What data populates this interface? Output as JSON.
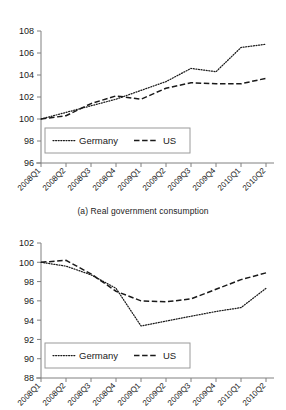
{
  "figure": {
    "panels": [
      {
        "id": "a",
        "caption": "(a)  Real government consumption",
        "caption_label": "(a)",
        "caption_title": "Real government consumption"
      },
      {
        "id": "b",
        "caption": "",
        "caption_label": "",
        "caption_title": ""
      }
    ]
  },
  "legend": {
    "germany": "Germany",
    "us": "US"
  },
  "chart_data": [
    {
      "type": "line",
      "title": "(a)  Real government consumption",
      "xlabel": "",
      "ylabel": "",
      "ylim": [
        96,
        108
      ],
      "yticks": [
        96,
        98,
        100,
        102,
        104,
        106,
        108
      ],
      "grid": false,
      "legend_position": "lower-center",
      "categories": [
        "2008Q1",
        "2008Q2",
        "2008Q3",
        "2008Q4",
        "2009Q1",
        "2009Q2",
        "2009Q3",
        "2009Q4",
        "2010Q1",
        "2010Q2"
      ],
      "series": [
        {
          "name": "Germany",
          "style": "dotted",
          "values": [
            100.0,
            100.6,
            101.2,
            101.8,
            102.6,
            103.4,
            104.6,
            104.3,
            106.5,
            106.8
          ]
        },
        {
          "name": "US",
          "style": "dashed",
          "values": [
            100.0,
            100.3,
            101.4,
            102.1,
            101.8,
            102.8,
            103.3,
            103.2,
            103.2,
            103.7
          ]
        }
      ]
    },
    {
      "type": "line",
      "title": "",
      "xlabel": "",
      "ylabel": "",
      "ylim": [
        88,
        102
      ],
      "yticks": [
        88,
        90,
        92,
        94,
        96,
        98,
        100,
        102
      ],
      "grid": false,
      "legend_position": "lower-center",
      "categories": [
        "2008Q1",
        "2008Q2",
        "2008Q3",
        "2008Q4",
        "2009Q1",
        "2009Q2",
        "2009Q3",
        "2009Q4",
        "2010Q1",
        "2010Q2"
      ],
      "series": [
        {
          "name": "Germany",
          "style": "dotted",
          "values": [
            100.0,
            99.6,
            98.7,
            97.3,
            93.4,
            93.9,
            94.4,
            94.9,
            95.3,
            97.3
          ]
        },
        {
          "name": "US",
          "style": "dashed",
          "values": [
            100.0,
            100.2,
            98.8,
            97.0,
            96.0,
            95.9,
            96.2,
            97.2,
            98.2,
            98.9
          ]
        }
      ]
    }
  ],
  "axis": {
    "panel_a_yticks": [
      "108",
      "106",
      "104",
      "102",
      "100",
      "98",
      "96"
    ],
    "panel_b_yticks": [
      "102",
      "100",
      "98",
      "96",
      "94",
      "92",
      "90",
      "88"
    ],
    "xticks_full": [
      "2008Q1",
      "2008Q2",
      "2008Q3",
      "2008Q4",
      "2009Q1",
      "2009Q2",
      "2009Q3",
      "2009Q4",
      "2010Q1",
      "2010Q2"
    ],
    "xticks_clipped": [
      "08Q1",
      "08Q2",
      "08Q3",
      "08Q4",
      "09Q1",
      "09Q2",
      "09Q3",
      "09Q4",
      "10Q1",
      "10Q2"
    ]
  }
}
